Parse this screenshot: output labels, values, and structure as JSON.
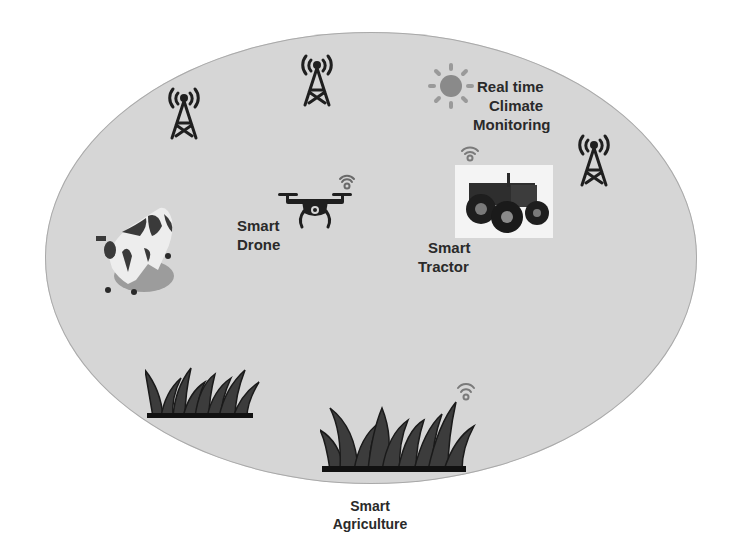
{
  "diagram": {
    "title": "Smart Agriculture",
    "title_lines": [
      "Smart",
      "Agriculture"
    ],
    "background_color": "#d6d6d6",
    "nodes": [
      {
        "id": "climate",
        "icon": "sun-icon",
        "label_lines": [
          "Real time",
          "Climate",
          "Monitoring"
        ]
      },
      {
        "id": "drone",
        "icon": "drone-icon",
        "label_lines": [
          "Smart",
          "Drone"
        ],
        "wireless": true
      },
      {
        "id": "tractor",
        "icon": "tractor-image",
        "label_lines": [
          "Smart",
          "Tractor"
        ],
        "wireless": true
      },
      {
        "id": "cow",
        "icon": "cow-icon",
        "label_lines": []
      },
      {
        "id": "grass-left",
        "icon": "grass-icon",
        "label_lines": []
      },
      {
        "id": "grass-right",
        "icon": "grass-icon",
        "label_lines": [],
        "wireless": true
      },
      {
        "id": "tower-1",
        "icon": "cell-tower-icon"
      },
      {
        "id": "tower-2",
        "icon": "cell-tower-icon"
      },
      {
        "id": "tower-3",
        "icon": "cell-tower-icon"
      }
    ]
  },
  "labels": {
    "climate_l1": "Real time",
    "climate_l2": "Climate",
    "climate_l3": "Monitoring",
    "drone_l1": "Smart",
    "drone_l2": "Drone",
    "tractor_l1": "Smart",
    "tractor_l2": "Tractor",
    "title_l1": "Smart",
    "title_l2": "Agriculture"
  }
}
